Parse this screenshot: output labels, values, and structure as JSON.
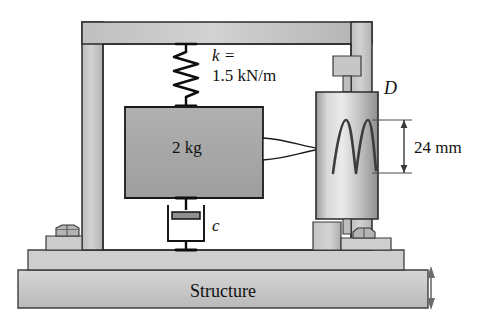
{
  "figure": {
    "type": "engineering-schematic",
    "background_color": "#ffffff",
    "ink_color": "#111111"
  },
  "labels": {
    "spring_symbol": "k =",
    "spring_value": "1.5 kN/m",
    "mass": "2 kg",
    "damper_symbol": "c",
    "cylinder_symbol": "D",
    "amplitude": "24 mm",
    "base": "Structure"
  },
  "components": {
    "frame": {
      "name": "rigid-frame",
      "fill": "#c9c9c9",
      "stroke": "#2b2b2b"
    },
    "mass_block": {
      "name": "mass-block",
      "fill": "#a8a8a8",
      "stroke": "#1a1a1a"
    },
    "cylinder": {
      "name": "recorder-cylinder",
      "fill_light": "#e2e2e2",
      "fill_dark": "#9a9a9a",
      "stroke": "#2b2b2b"
    },
    "baseplate": {
      "name": "structure-baseplate",
      "fill": "#cccccc",
      "stroke": "#3a3a3a"
    },
    "spring": {
      "name": "coil-spring",
      "stroke": "#0d0d0d",
      "coils": 6
    },
    "dashpot": {
      "name": "dashpot-damper",
      "stroke": "#1a1a1a"
    },
    "trace": {
      "name": "oscillation-trace",
      "stroke": "#3c3c3c",
      "cycles": 2
    },
    "motion_arrow": {
      "name": "vertical-motion-arrow",
      "direction": "double-vertical",
      "stroke": "#555555"
    },
    "bolts": {
      "name": "anchor-bolt",
      "count": 2,
      "fill": "#b4b4b4",
      "stroke": "#333333"
    }
  }
}
